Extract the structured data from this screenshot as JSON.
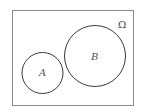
{
  "diagram": {
    "type": "venn",
    "universe": {
      "label": "Ω"
    },
    "sets": [
      {
        "id": "A",
        "label": "A"
      },
      {
        "id": "B",
        "label": "B"
      }
    ],
    "relation": "disjoint",
    "colors": {
      "stroke": "#3a3a3a",
      "frame": "#8a8a8a",
      "background": "#ffffff"
    }
  }
}
